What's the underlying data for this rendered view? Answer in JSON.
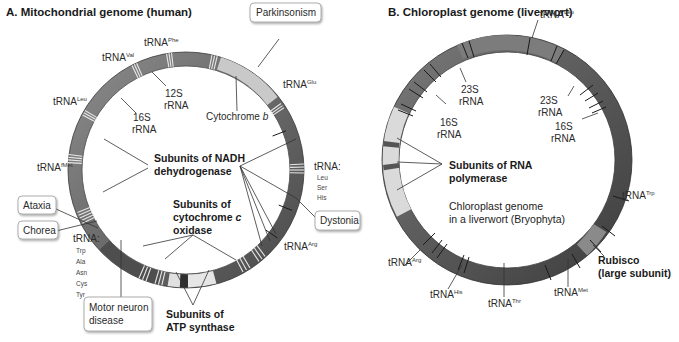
{
  "panel_a": {
    "title": "A. Mitochondrial genome (human)",
    "ring": {
      "cx": 186,
      "cy": 170,
      "outer_r": 118,
      "inner_r": 104,
      "color": "#6e6e6e",
      "light_color": "#c8c8c8"
    },
    "labels": {
      "trna_phe": {
        "base": "tRNA",
        "sup": "Phe"
      },
      "trna_val": {
        "base": "tRNA",
        "sup": "Val"
      },
      "trna_leu": {
        "base": "tRNA",
        "sup": "Leu"
      },
      "trna_glu": {
        "base": "tRNA",
        "sup": "Glu"
      },
      "trna_fmet": {
        "base": "tRNA",
        "sup": "fMet"
      },
      "trna_arg": {
        "base": "tRNA",
        "sup": "Arg"
      },
      "trna_lsh": {
        "base": "tRNA:",
        "list": [
          "Leu",
          "Ser",
          "His"
        ]
      },
      "trna_group": {
        "base": "tRNA:",
        "list": [
          "Trp",
          "Ala",
          "Asn",
          "Cys",
          "Tyr"
        ]
      },
      "rrna_12s": {
        "line1": "12S",
        "line2": "rRNA"
      },
      "rrna_16s": {
        "line1": "16S",
        "line2": "rRNA"
      },
      "cytochrome_b": {
        "text": "Cytochrome ",
        "italic": "b"
      },
      "nadh": {
        "line1": "Subunits of NADH",
        "line2": "dehydrogenase"
      },
      "cox": {
        "line1": "Subunits of",
        "line2": "cytochrome ",
        "line2_italic": "c",
        "line3": "oxidase"
      },
      "atp": {
        "line1": "Subunits of",
        "line2": "ATP synthase"
      }
    },
    "disease_boxes": {
      "parkinsonism": "Parkinsonism",
      "ataxia": "Ataxia",
      "chorea": "Chorea",
      "dystonia": "Dystonia",
      "motor_neuron": {
        "line1": "Motor neuron",
        "line2": "disease"
      }
    }
  },
  "panel_b": {
    "title": "B. Chloroplast genome (liverwort)",
    "ring": {
      "cx": 507,
      "cy": 160,
      "outer_r": 125,
      "inner_r": 108,
      "color": "#5e5e5e",
      "light_color": "#d9d9d9"
    },
    "labels": {
      "trna_leu": {
        "base": "tRNA",
        "sup": "Leu"
      },
      "trna_trp": {
        "base": "tRNA",
        "sup": "Trp"
      },
      "trna_arg": {
        "base": "tRNA",
        "sup": "Arg"
      },
      "trna_his": {
        "base": "tRNA",
        "sup": "His"
      },
      "trna_thr": {
        "base": "tRNA",
        "sup": "Thr"
      },
      "trna_met": {
        "base": "tRNA",
        "sup": "Met"
      },
      "rrna_23s_left": {
        "line1": "23S",
        "line2": "rRNA"
      },
      "rrna_23s_right": {
        "line1": "23S",
        "line2": "rRNA"
      },
      "rrna_16s_left": {
        "line1": "16S",
        "line2": "rRNA"
      },
      "rrna_16s_right": {
        "line1": "16S",
        "line2": "rRNA"
      },
      "rna_pol": {
        "line1": "Subunits of RNA",
        "line2": "polymerase"
      },
      "center": {
        "line1": "Chloroplast genome",
        "line2": "in a liverwort (Bryophyta)"
      },
      "rubisco": {
        "line1": "Rubisco",
        "line2": "(large subunit)"
      }
    }
  }
}
